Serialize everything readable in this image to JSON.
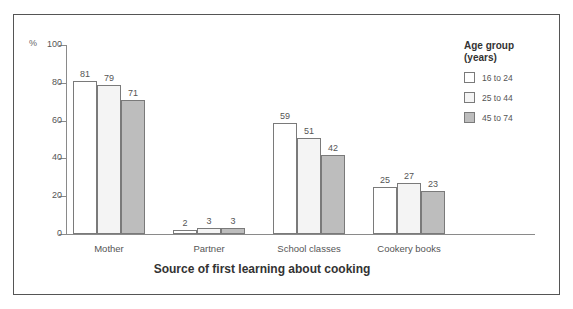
{
  "chart_data": {
    "type": "bar",
    "title": "",
    "xlabel": "Source of first learning about cooking",
    "ylabel": "%",
    "ylim": [
      0,
      100
    ],
    "yticks": [
      0,
      20,
      40,
      60,
      80,
      100
    ],
    "ytick_labels": [
      "0",
      "20",
      "40",
      "60",
      "80",
      "100"
    ],
    "grid": false,
    "legend_position": "right",
    "legend_title": "Age group (years)",
    "categories": [
      "Mother",
      "Partner",
      "School classes",
      "Cookery books"
    ],
    "series": [
      {
        "name": "16 to 24",
        "color": "#ffffff",
        "values": [
          81,
          2,
          59,
          25
        ]
      },
      {
        "name": "25 to 44",
        "color": "#f4f4f4",
        "values": [
          79,
          3,
          51,
          27
        ]
      },
      {
        "name": "45 to 74",
        "color": "#bdbdbd",
        "values": [
          71,
          3,
          42,
          23
        ]
      }
    ]
  },
  "axis": {
    "percent_symbol": "%",
    "x_title": "Source of first learning about cooking"
  },
  "legend": {
    "title_line1": "Age group",
    "title_line2": "(years)",
    "items": [
      {
        "label": "16 to 24",
        "color": "#ffffff"
      },
      {
        "label": "25 to 44",
        "color": "#f4f4f4"
      },
      {
        "label": "45 to 74",
        "color": "#bdbdbd"
      }
    ]
  },
  "caption": {
    "clipped_text": ""
  }
}
